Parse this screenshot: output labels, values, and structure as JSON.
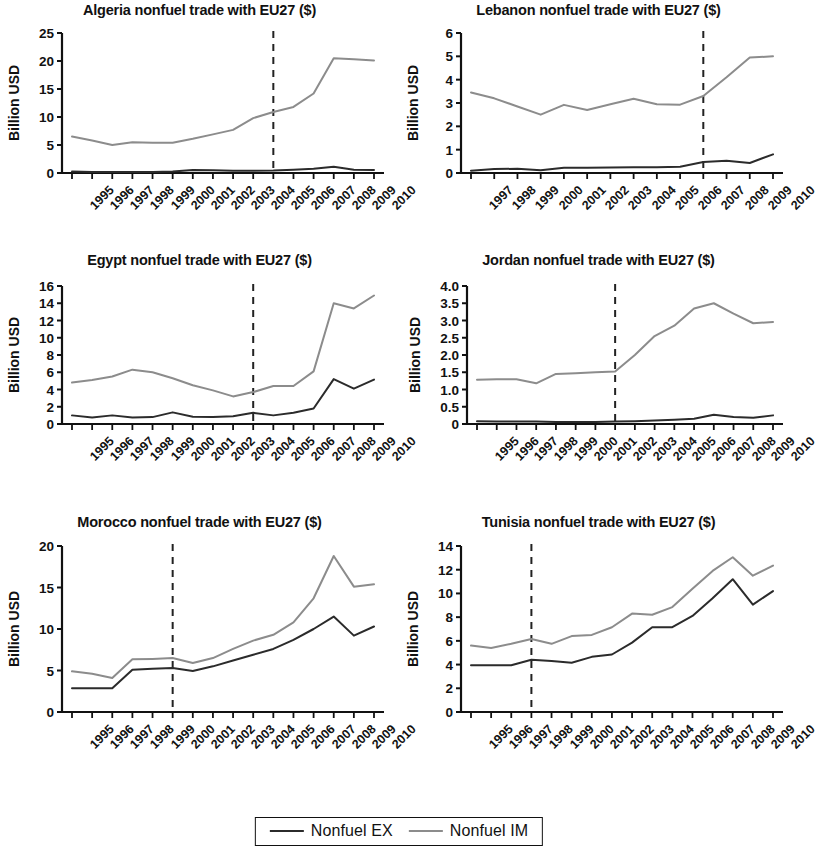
{
  "figure": {
    "legend": {
      "entries": [
        {
          "label": "Nonfuel EX",
          "color": "#2b2b2b",
          "width": 2.2
        },
        {
          "label": "Nonfuel IM",
          "color": "#8c8c8c",
          "width": 2.2
        }
      ]
    },
    "ylabel_text": "Billion USD",
    "series_names": {
      "ex": "Nonfuel EX",
      "im": "Nonfuel IM"
    },
    "colors": {
      "ex": "#2b2b2b",
      "im": "#8c8c8c",
      "axis": "#111111",
      "dashed": "#222222"
    }
  },
  "chart_data": [
    {
      "type": "line",
      "title": "Algeria nonfuel trade with EU27 ($)",
      "xlabel": "",
      "ylabel": "Billion USD",
      "x": [
        "1995",
        "1996",
        "1997",
        "1998",
        "1999",
        "2000",
        "2001",
        "2002",
        "2003",
        "2004",
        "2005",
        "2006",
        "2007",
        "2008",
        "2009",
        "2010"
      ],
      "ylim": [
        0,
        25
      ],
      "yticks": [
        0,
        5,
        10,
        15,
        20,
        25
      ],
      "ytick_labels": [
        "0",
        "5",
        "10",
        "15",
        "20",
        "25"
      ],
      "grid": false,
      "vline_x": "2005",
      "vline_style": "dashed",
      "series": [
        {
          "name": "Nonfuel EX",
          "values": [
            0.25,
            0.2,
            0.2,
            0.2,
            0.2,
            0.25,
            0.55,
            0.5,
            0.4,
            0.4,
            0.45,
            0.6,
            0.75,
            1.1,
            0.6,
            0.55
          ]
        },
        {
          "name": "Nonfuel IM",
          "values": [
            6.5,
            5.8,
            5.0,
            5.5,
            5.4,
            5.4,
            6.1,
            6.9,
            7.7,
            9.8,
            10.9,
            11.8,
            14.2,
            20.5,
            20.3,
            20.1
          ]
        }
      ]
    },
    {
      "type": "line",
      "title": "Lebanon  nonfuel trade with EU27 ($)",
      "xlabel": "",
      "ylabel": "Billion USD",
      "x": [
        "1997",
        "1998",
        "1999",
        "2000",
        "2001",
        "2002",
        "2003",
        "2004",
        "2005",
        "2006",
        "2007",
        "2008",
        "2009",
        "2010"
      ],
      "ylim": [
        0,
        6
      ],
      "yticks": [
        0,
        1,
        2,
        3,
        4,
        5,
        6
      ],
      "ytick_labels": [
        "0",
        "1",
        "2",
        "3",
        "4",
        "5",
        "6"
      ],
      "grid": false,
      "vline_x": "2007",
      "vline_style": "dashed",
      "series": [
        {
          "name": "Nonfuel EX",
          "values": [
            0.1,
            0.17,
            0.18,
            0.12,
            0.22,
            0.22,
            0.24,
            0.25,
            0.25,
            0.27,
            0.47,
            0.52,
            0.43,
            0.8
          ]
        },
        {
          "name": "Nonfuel IM",
          "values": [
            3.45,
            3.2,
            2.85,
            2.5,
            2.92,
            2.7,
            2.95,
            3.18,
            2.95,
            2.93,
            3.3,
            4.1,
            4.95,
            5.0
          ]
        }
      ]
    },
    {
      "type": "line",
      "title": "Egypt nonfuel trade with EU27 ($)",
      "xlabel": "",
      "ylabel": "Billion USD",
      "x": [
        "1995",
        "1996",
        "1997",
        "1998",
        "1999",
        "2000",
        "2001",
        "2002",
        "2003",
        "2004",
        "2005",
        "2006",
        "2007",
        "2008",
        "2009",
        "2010"
      ],
      "ylim": [
        0,
        16
      ],
      "yticks": [
        0,
        2,
        4,
        6,
        8,
        10,
        12,
        14,
        16
      ],
      "ytick_labels": [
        "0",
        "2",
        "4",
        "6",
        "8",
        "10",
        "12",
        "14",
        "16"
      ],
      "grid": false,
      "vline_x": "2004",
      "vline_style": "dashed",
      "series": [
        {
          "name": "Nonfuel EX",
          "values": [
            1.0,
            0.75,
            1.0,
            0.75,
            0.8,
            1.35,
            0.85,
            0.8,
            0.9,
            1.3,
            1.0,
            1.3,
            1.8,
            5.2,
            4.1,
            5.15
          ]
        },
        {
          "name": "Nonfuel IM",
          "values": [
            4.8,
            5.1,
            5.5,
            6.3,
            6.0,
            5.3,
            4.5,
            3.9,
            3.2,
            3.7,
            4.4,
            4.4,
            6.1,
            14.0,
            13.4,
            14.9
          ]
        }
      ]
    },
    {
      "type": "line",
      "title": "Jordan nonfuel trade with EU27 ($)",
      "xlabel": "",
      "ylabel": "Billion USD",
      "x": [
        "1995",
        "1996",
        "1997",
        "1998",
        "1999",
        "2000",
        "2001",
        "2002",
        "2003",
        "2004",
        "2005",
        "2006",
        "2007",
        "2008",
        "2009",
        "2010"
      ],
      "ylim": [
        0,
        4.0
      ],
      "yticks": [
        0,
        0.5,
        1.0,
        1.5,
        2.0,
        2.5,
        3.0,
        3.5,
        4.0
      ],
      "ytick_labels": [
        "0",
        "0.5",
        "1.0",
        "1.5",
        "2.0",
        "2.5",
        "3.0",
        "3.5",
        "4.0"
      ],
      "grid": false,
      "vline_x": "2002",
      "vline_style": "dashed",
      "series": [
        {
          "name": "Nonfuel EX",
          "values": [
            0.08,
            0.07,
            0.07,
            0.07,
            0.06,
            0.06,
            0.06,
            0.07,
            0.08,
            0.1,
            0.12,
            0.15,
            0.27,
            0.2,
            0.18,
            0.25
          ]
        },
        {
          "name": "Nonfuel IM",
          "values": [
            1.28,
            1.3,
            1.3,
            1.18,
            1.45,
            1.47,
            1.5,
            1.52,
            2.0,
            2.55,
            2.85,
            3.35,
            3.5,
            3.2,
            2.92,
            2.96
          ]
        }
      ]
    },
    {
      "type": "line",
      "title": "Morocco nonfuel trade with EU27 ($)",
      "xlabel": "",
      "ylabel": "Billion USD",
      "x": [
        "1995",
        "1996",
        "1997",
        "1998",
        "1999",
        "2000",
        "2001",
        "2002",
        "2003",
        "2004",
        "2005",
        "2006",
        "2007",
        "2008",
        "2009",
        "2010"
      ],
      "ylim": [
        0,
        20
      ],
      "yticks": [
        0,
        5,
        10,
        15,
        20
      ],
      "ytick_labels": [
        "0",
        "5",
        "10",
        "15",
        "20"
      ],
      "grid": false,
      "vline_x": "2000",
      "vline_style": "dashed",
      "series": [
        {
          "name": "Nonfuel EX",
          "values": [
            2.85,
            2.85,
            2.85,
            5.1,
            5.2,
            5.3,
            4.95,
            5.5,
            6.2,
            6.9,
            7.6,
            8.7,
            10.0,
            11.5,
            9.2,
            10.3
          ]
        },
        {
          "name": "Nonfuel IM",
          "values": [
            4.9,
            4.6,
            4.1,
            6.35,
            6.4,
            6.5,
            5.9,
            6.5,
            7.6,
            8.6,
            9.3,
            10.8,
            13.7,
            18.8,
            15.1,
            15.4
          ]
        }
      ]
    },
    {
      "type": "line",
      "title": "Tunisia nonfuel trade with EU27 ($)",
      "xlabel": "",
      "ylabel": "Billion USD",
      "x": [
        "1995",
        "1996",
        "1997",
        "1998",
        "1999",
        "2000",
        "2001",
        "2002",
        "2003",
        "2004",
        "2005",
        "2006",
        "2007",
        "2008",
        "2009",
        "2010"
      ],
      "ylim": [
        0,
        14
      ],
      "yticks": [
        0,
        2,
        4,
        6,
        8,
        10,
        12,
        14
      ],
      "ytick_labels": [
        "0",
        "2",
        "4",
        "6",
        "8",
        "10",
        "12",
        "14"
      ],
      "grid": false,
      "vline_x": "1998",
      "vline_style": "dashed",
      "series": [
        {
          "name": "Nonfuel EX",
          "values": [
            3.95,
            3.95,
            3.95,
            4.4,
            4.3,
            4.15,
            4.65,
            4.85,
            5.85,
            7.15,
            7.15,
            8.1,
            9.6,
            11.2,
            9.05,
            10.2
          ]
        },
        {
          "name": "Nonfuel IM",
          "values": [
            5.6,
            5.4,
            5.75,
            6.15,
            5.75,
            6.4,
            6.5,
            7.15,
            8.3,
            8.2,
            8.85,
            10.4,
            11.9,
            13.05,
            11.5,
            12.35
          ]
        }
      ]
    }
  ]
}
